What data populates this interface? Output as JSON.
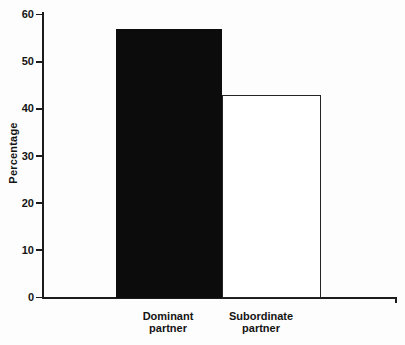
{
  "chart_data": {
    "type": "bar",
    "title": "",
    "categories": [
      "Dominant partner",
      "Subordinate partner"
    ],
    "values": [
      57,
      43
    ],
    "xlabel": "",
    "ylabel": "Percentage",
    "ylim": [
      0,
      60
    ],
    "yticks": [
      0,
      10,
      20,
      30,
      40,
      50,
      60
    ],
    "grid": false,
    "legend": "none",
    "bar_styles": [
      {
        "fill": "#0c0c0c",
        "border": "#0c0c0c"
      },
      {
        "fill": "#ffffff",
        "border": "#242424"
      }
    ]
  },
  "colors": {
    "axis": "#1c1c1c",
    "text": "#141414",
    "background": "#fdfdfd"
  }
}
